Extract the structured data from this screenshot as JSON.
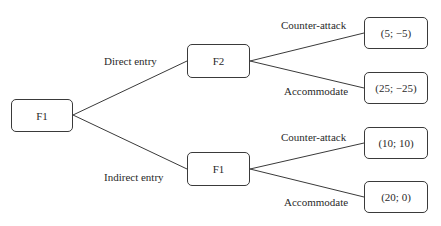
{
  "diagram": {
    "type": "game-tree",
    "nodes": {
      "root": {
        "label": "F1"
      },
      "upper": {
        "label": "F2"
      },
      "lower": {
        "label": "F1"
      }
    },
    "edges": {
      "root_upper": "Direct entry",
      "root_lower": "Indirect entry",
      "upper_t1": "Counter-attack",
      "upper_t2": "Accommodate",
      "lower_t3": "Counter-attack",
      "lower_t4": "Accommodate"
    },
    "payoffs": {
      "t1": "(5; −5)",
      "t2": "(25; −25)",
      "t3": "(10; 10)",
      "t4": "(20; 0)"
    },
    "colors": {
      "line": "#3a3a3a",
      "text": "#2a2a2a",
      "background": "#ffffff"
    }
  }
}
